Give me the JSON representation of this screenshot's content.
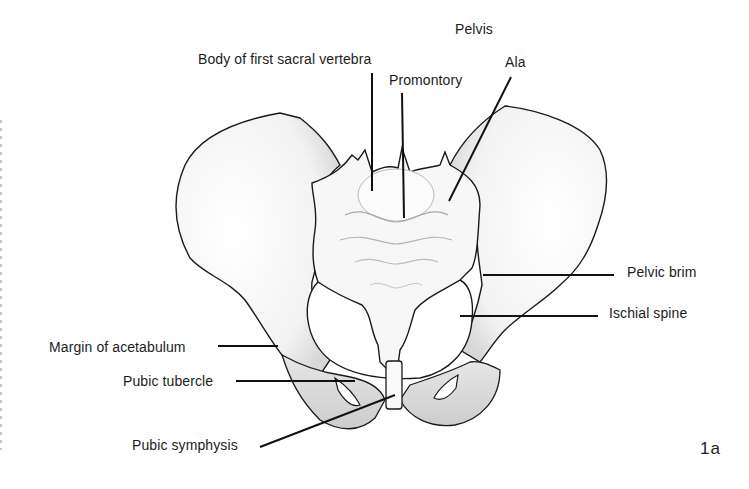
{
  "diagram": {
    "title": "Pelvis",
    "figure_number": "1a",
    "labels": {
      "body_first_sacral_vertebra": "Body of first sacral vertebra",
      "promontory": "Promontory",
      "ala": "Ala",
      "pelvic_brim": "Pelvic brim",
      "ischial_spine": "Ischial spine",
      "margin_of_acetabulum": "Margin of acetabulum",
      "pubic_tubercle": "Pubic tubercle",
      "pubic_symphysis": "Pubic symphysis"
    },
    "colors": {
      "background": "#ffffff",
      "outline": "#1a1a1a",
      "shading": "#cfcfcf",
      "text": "#1c1c1c"
    }
  }
}
